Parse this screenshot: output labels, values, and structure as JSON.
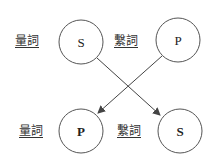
{
  "diagram": {
    "top_row": {
      "left_word": "量詞",
      "left_node": "S",
      "right_word": "繫詞",
      "right_node": "P"
    },
    "bottom_row": {
      "left_word": "量詞",
      "left_node": "P",
      "right_word": "繫詞",
      "right_node": "S"
    },
    "arrows": [
      {
        "from": "top S",
        "to": "bottom S"
      },
      {
        "from": "top P",
        "to": "bottom P"
      }
    ],
    "colors": {
      "stroke": "#444444",
      "text": "#222222",
      "background": "#ffffff"
    }
  }
}
